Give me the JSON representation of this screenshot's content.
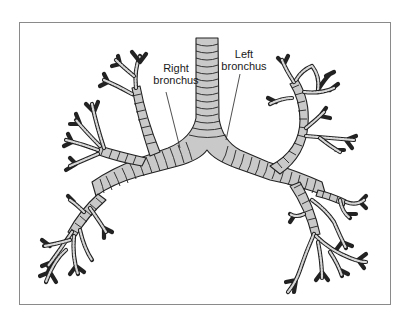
{
  "figure": {
    "type": "anatomical illustration",
    "frame_border_color": "#8a8a8a",
    "tube_fill_color": "#c9c9c9",
    "outline_color": "#222222"
  },
  "labels": {
    "right_bronchus": "Right\nbronchus",
    "right_bronchus_line1": "Right",
    "right_bronchus_line2": "bronchus",
    "left_bronchus_line1": "Left",
    "left_bronchus_line2": "bronchus"
  }
}
